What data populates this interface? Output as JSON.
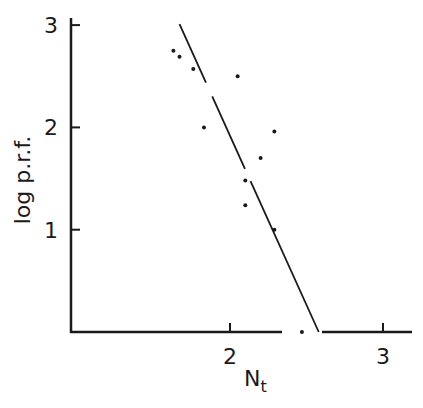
{
  "chart_data": {
    "type": "scatter",
    "title": "",
    "xlabel": "N_t",
    "xlabel_main": "N",
    "xlabel_sub": "t",
    "ylabel": "log p.r.f.",
    "xlim": [
      1.0,
      3.2
    ],
    "ylim": [
      0,
      3.05
    ],
    "x_ticks": [
      2,
      3
    ],
    "x_tick_labels": [
      "2",
      "3"
    ],
    "y_ticks": [
      1,
      2,
      3
    ],
    "y_tick_labels": [
      "1",
      "2",
      "3"
    ],
    "grid": false,
    "legend": null,
    "series": [
      {
        "name": "observations",
        "points": [
          {
            "x": 1.63,
            "y": 2.75
          },
          {
            "x": 1.67,
            "y": 2.69
          },
          {
            "x": 1.76,
            "y": 2.57
          },
          {
            "x": 2.05,
            "y": 2.5
          },
          {
            "x": 1.83,
            "y": 2.0
          },
          {
            "x": 2.29,
            "y": 1.96
          },
          {
            "x": 2.2,
            "y": 1.7
          },
          {
            "x": 2.1,
            "y": 1.48
          },
          {
            "x": 2.1,
            "y": 1.24
          },
          {
            "x": 2.29,
            "y": 1.0
          },
          {
            "x": 2.47,
            "y": 0.0
          }
        ]
      },
      {
        "name": "fitted line",
        "type": "line",
        "points": [
          {
            "x": 1.67,
            "y": 3.01
          },
          {
            "x": 2.58,
            "y": 0.0
          }
        ]
      }
    ],
    "colors": {
      "ink": "#1a1a1a",
      "background": "#ffffff"
    }
  }
}
